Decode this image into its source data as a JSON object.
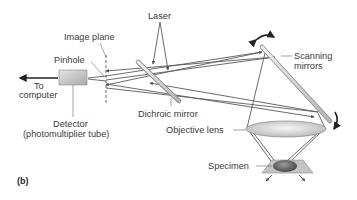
{
  "diagram": {
    "panel_label": "(b)",
    "labels": {
      "laser": "Laser",
      "image_plane": "Image plane",
      "pinhole": "Pinhole",
      "to": "To",
      "computer": "computer",
      "detector": "Detector",
      "detector_sub": "(photomultiplier tube)",
      "dichroic_mirror": "Dichroic mirror",
      "objective_lens": "Objective lens",
      "scanning": "Scanning",
      "mirrors": "mirrors",
      "specimen": "Specimen"
    },
    "colors": {
      "beam": "#555555",
      "text": "#3a3a3a",
      "detector_fill": "#c8c8c8",
      "lens_fill": "#d9d9d9",
      "specimen_fill": "#6e6e6e",
      "stage_fill": "#bdbdbd"
    }
  }
}
